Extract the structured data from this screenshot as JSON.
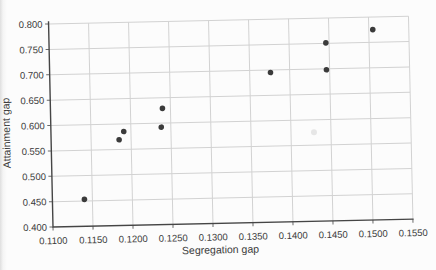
{
  "chart_data": {
    "type": "scatter",
    "title": "",
    "xlabel": "Segregation gap",
    "ylabel": "Attainment gap",
    "xlim": [
      0.11,
      0.155
    ],
    "ylim": [
      0.4,
      0.8
    ],
    "grid": true,
    "legend": false,
    "x_tick_values": [
      0.11,
      0.115,
      0.12,
      0.125,
      0.13,
      0.135,
      0.14,
      0.145,
      0.15,
      0.155
    ],
    "x_tick_labels": [
      "0.1100",
      "0.1150",
      "0.1200",
      "0.1250",
      "0.1300",
      "0.1350",
      "0.1400",
      "0.1450",
      "0.1500",
      "0.1550"
    ],
    "y_tick_values": [
      0.4,
      0.45,
      0.5,
      0.55,
      0.6,
      0.65,
      0.7,
      0.75,
      0.8
    ],
    "y_tick_labels": [
      "0.400",
      "0.450",
      "0.500",
      "0.550",
      "0.600",
      "0.650",
      "0.700",
      "0.750",
      "0.800"
    ],
    "points": [
      {
        "x": 0.114,
        "y": 0.453
      },
      {
        "x": 0.1185,
        "y": 0.569
      },
      {
        "x": 0.1191,
        "y": 0.585
      },
      {
        "x": 0.1238,
        "y": 0.592
      },
      {
        "x": 0.124,
        "y": 0.629
      },
      {
        "x": 0.1376,
        "y": 0.695
      },
      {
        "x": 0.1446,
        "y": 0.698
      },
      {
        "x": 0.1446,
        "y": 0.751
      },
      {
        "x": 0.1505,
        "y": 0.775
      }
    ],
    "colors": {
      "marker": "#3b3b3b",
      "grid": "#d2d2d2",
      "axis": "#454545",
      "tick": "#6a6a6a",
      "text": "#3a3a3a"
    }
  }
}
